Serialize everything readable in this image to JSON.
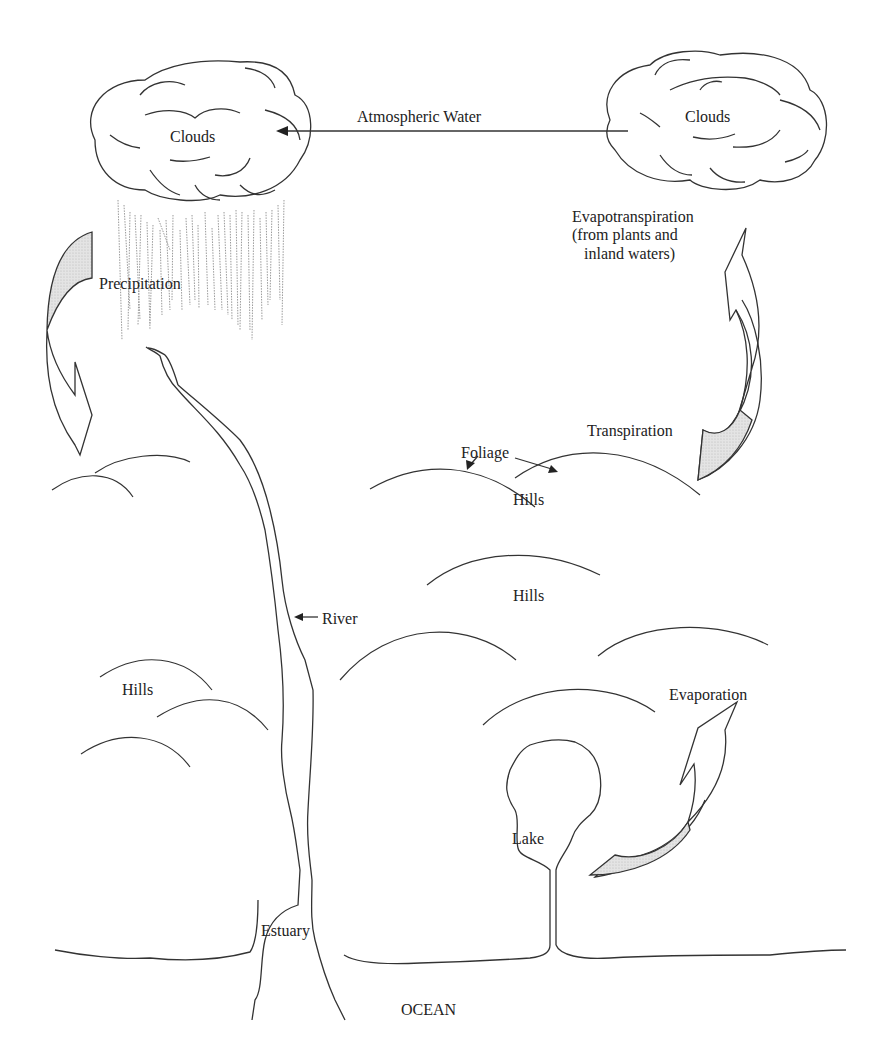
{
  "diagram": {
    "colors": {
      "line": "#333333",
      "arrow_fill": "#d9d9d9",
      "rain": "#999999",
      "background": "#ffffff"
    },
    "labels": {
      "clouds_left": "Clouds",
      "clouds_right": "Clouds",
      "atmospheric_water": "Atmospheric Water",
      "evapotranspiration": "Evapotranspiration\n(from plants and\n   inland waters)",
      "precipitation": "Precipitation",
      "transpiration": "Transpiration",
      "foliage": "Foliage",
      "hills_foliage": "Hills",
      "hills_center": "Hills",
      "hills_left": "Hills",
      "river": "River",
      "evaporation": "Evaporation",
      "lake": "Lake",
      "estuary": "Estuary",
      "ocean": "OCEAN"
    }
  }
}
